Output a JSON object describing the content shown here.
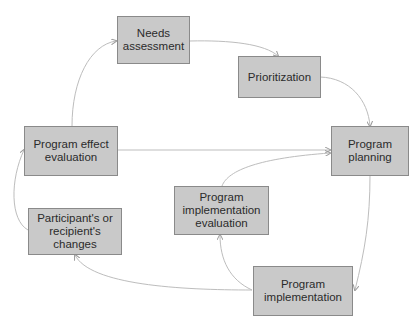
{
  "nodes": [
    {
      "id": "needs",
      "label": "Needs\nassessment"
    },
    {
      "id": "prior",
      "label": "Prioritization"
    },
    {
      "id": "planning",
      "label": "Program\nplanning"
    },
    {
      "id": "effect",
      "label": "Program effect\nevaluation"
    },
    {
      "id": "impl_eval",
      "label": "Program\nimplementation\nevaluation"
    },
    {
      "id": "participant",
      "label": "Participant's or\nrecipient's\nchanges"
    },
    {
      "id": "implementation",
      "label": "Program\nimplementation"
    }
  ],
  "edges": [
    {
      "from": "effect",
      "to": "needs"
    },
    {
      "from": "needs",
      "to": "prior"
    },
    {
      "from": "prior",
      "to": "planning"
    },
    {
      "from": "effect",
      "to": "planning"
    },
    {
      "from": "impl_eval",
      "to": "planning"
    },
    {
      "from": "planning",
      "to": "implementation"
    },
    {
      "from": "implementation",
      "to": "impl_eval"
    },
    {
      "from": "implementation",
      "to": "participant"
    },
    {
      "from": "participant",
      "to": "effect"
    }
  ]
}
